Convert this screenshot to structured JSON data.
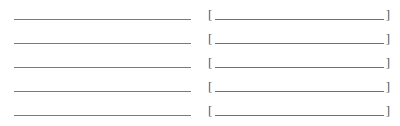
{
  "form": {
    "rows": [
      {
        "left_value": "",
        "right_value": "",
        "open_bracket": "[",
        "close_bracket": "]"
      },
      {
        "left_value": "",
        "right_value": "",
        "open_bracket": "[",
        "close_bracket": "]"
      },
      {
        "left_value": "",
        "right_value": "",
        "open_bracket": "[",
        "close_bracket": "]"
      },
      {
        "left_value": "",
        "right_value": "",
        "open_bracket": "[",
        "close_bracket": "]"
      },
      {
        "left_value": "",
        "right_value": "",
        "open_bracket": "[",
        "close_bracket": "]"
      }
    ]
  },
  "colors": {
    "line": "#7a7a7a",
    "bracket": "#555555",
    "background": "#ffffff"
  }
}
